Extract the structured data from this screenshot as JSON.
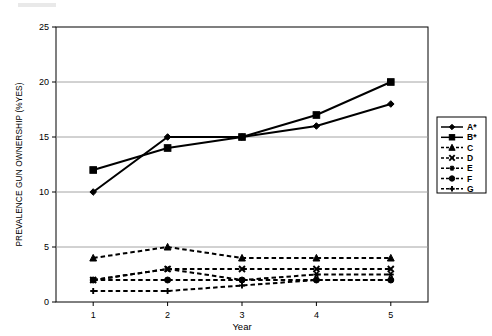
{
  "chart_data": {
    "type": "line",
    "title": "",
    "xlabel": "Year",
    "ylabel": "PREVALENCE GUN OWNERSHIP (%YES)",
    "categories": [
      "1",
      "2",
      "3",
      "4",
      "5"
    ],
    "x": [
      1,
      2,
      3,
      4,
      5
    ],
    "xlim": [
      0.5,
      5.5
    ],
    "ylim": [
      0,
      25
    ],
    "yticks": [
      "0",
      "5",
      "10",
      "15",
      "20",
      "25"
    ],
    "ytick_values": [
      0,
      5,
      10,
      15,
      20,
      25
    ],
    "grid": "horizontal",
    "legend_position": "right",
    "series": [
      {
        "name": "A*",
        "marker": "diamond",
        "line": "solid",
        "values": [
          10,
          15,
          15,
          16,
          18
        ]
      },
      {
        "name": "B*",
        "marker": "square",
        "line": "solid",
        "values": [
          12,
          14,
          15,
          17,
          20
        ]
      },
      {
        "name": "C",
        "marker": "triangle",
        "line": "dashed",
        "values": [
          4,
          5,
          4,
          4,
          4
        ]
      },
      {
        "name": "D",
        "marker": "cross",
        "line": "dashed",
        "values": [
          2,
          3,
          3,
          3,
          3
        ]
      },
      {
        "name": "E",
        "marker": "star",
        "line": "dashed",
        "values": [
          2,
          3,
          2,
          2.5,
          2.5
        ]
      },
      {
        "name": "F",
        "marker": "circle",
        "line": "dashed",
        "values": [
          2,
          2,
          2,
          2,
          2
        ]
      },
      {
        "name": "G",
        "marker": "plus",
        "line": "dashed",
        "values": [
          1,
          1,
          1.5,
          2,
          2
        ]
      }
    ]
  },
  "legend": {
    "entries": [
      "A*",
      "B*",
      "C",
      "D",
      "E",
      "F",
      "G"
    ]
  }
}
